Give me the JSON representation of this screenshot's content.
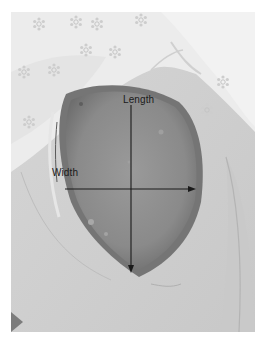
{
  "image": {
    "subject": "wound photograph with measurement axes",
    "tone": "grayscale",
    "colors": {
      "page_background": "#ffffff",
      "sheet_light": "#eeeeee",
      "skin": "#cfcfcf",
      "wound_bed": "#8e8e8e",
      "wound_rim": "#6f6f6f",
      "annotation": "#1a1a1a"
    }
  },
  "annotations": {
    "length": {
      "label": "Length",
      "direction": "down",
      "x": 131,
      "y_start": 105,
      "y_end": 273
    },
    "width": {
      "label": "Width",
      "direction": "right",
      "y": 189,
      "x_start": 65,
      "x_end": 196
    }
  }
}
